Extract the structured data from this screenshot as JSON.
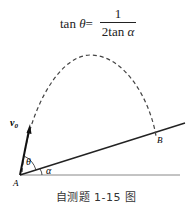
{
  "formula": {
    "lhs_func": "tan",
    "lhs_var": "θ",
    "equals": "=",
    "numerator": "1",
    "denominator_coef": "2tan",
    "denominator_var": "α"
  },
  "labels": {
    "velocity": "v",
    "velocity_sub": "0",
    "theta": "θ",
    "alpha": "α",
    "point_a": "A",
    "point_b": "B"
  },
  "caption": "自测题 1-15 图"
}
